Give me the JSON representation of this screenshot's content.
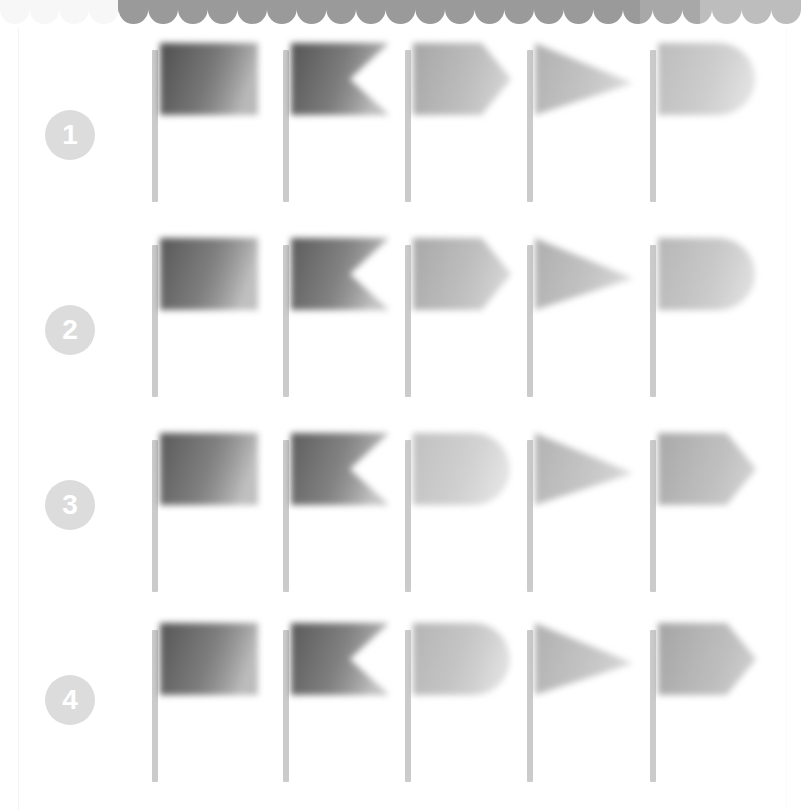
{
  "page": {
    "background_color": "#ffffff",
    "width": 801,
    "height": 810
  },
  "top_strip": {
    "name": "scalloped-top-strip",
    "style": "wavy-scallop",
    "segments": [
      {
        "from_x": 0,
        "to_x": 118,
        "color": "#f7f7f7"
      },
      {
        "from_x": 118,
        "to_x": 640,
        "color": "#9a9a9a"
      },
      {
        "from_x": 640,
        "to_x": 700,
        "color": "#a8a8a8"
      },
      {
        "from_x": 700,
        "to_x": 801,
        "color": "#bdbdbd"
      }
    ],
    "scallop_count": 27,
    "height": 24
  },
  "badge_style": {
    "fill_color": "#dcdcdc",
    "text_color": "#ffffff",
    "diameter": 50
  },
  "pole": {
    "color": "#cbcbcb",
    "width": 6,
    "height": 152
  },
  "flag_shapes": {
    "rectangle": "rectangle",
    "swallowtail": "swallowtail",
    "pointed": "pointed-pennant",
    "triangle": "triangle-pennant",
    "rounded": "rounded-end"
  },
  "rows": [
    {
      "number": "1",
      "badge_name": "row-badge-1",
      "top": 40,
      "badge_top": 110,
      "flags": [
        {
          "shape": "rectangle",
          "label": "rectangle-flag",
          "dark": "#4f4f4f",
          "light": "#b9b9b9",
          "left": 152
        },
        {
          "shape": "swallowtail",
          "label": "swallowtail-flag",
          "dark": "#555555",
          "light": "#bdbdbd",
          "left": 283
        },
        {
          "shape": "pointed",
          "label": "pointed-flag",
          "dark": "#a6a6a6",
          "light": "#d2d2d2",
          "left": 405
        },
        {
          "shape": "triangle",
          "label": "triangle-flag",
          "dark": "#b0b0b0",
          "light": "#dadada",
          "left": 527
        },
        {
          "shape": "rounded",
          "label": "rounded-flag",
          "dark": "#bcbcbc",
          "light": "#e0e0e0",
          "left": 650
        }
      ]
    },
    {
      "number": "2",
      "badge_name": "row-badge-2",
      "top": 235,
      "badge_top": 305,
      "flags": [
        {
          "shape": "rectangle",
          "label": "rectangle-flag",
          "dark": "#585858",
          "light": "#c0c0c0",
          "left": 152
        },
        {
          "shape": "swallowtail",
          "label": "swallowtail-flag",
          "dark": "#5c5c5c",
          "light": "#c2c2c2",
          "left": 283
        },
        {
          "shape": "pointed",
          "label": "pointed-flag",
          "dark": "#a8a8a8",
          "light": "#d4d4d4",
          "left": 405
        },
        {
          "shape": "triangle",
          "label": "triangle-flag",
          "dark": "#aeaeae",
          "light": "#d8d8d8",
          "left": 527
        },
        {
          "shape": "rounded",
          "label": "rounded-flag",
          "dark": "#b6b6b6",
          "light": "#dcdcdc",
          "left": 650
        }
      ]
    },
    {
      "number": "3",
      "badge_name": "row-badge-3",
      "top": 430,
      "badge_top": 480,
      "flags": [
        {
          "shape": "rectangle",
          "label": "rectangle-flag",
          "dark": "#5a5a5a",
          "light": "#c0c0c0",
          "left": 152
        },
        {
          "shape": "swallowtail",
          "label": "swallowtail-flag",
          "dark": "#5e5e5e",
          "light": "#c4c4c4",
          "left": 283
        },
        {
          "shape": "rounded",
          "label": "rounded-flag",
          "dark": "#c0c0c0",
          "light": "#e2e2e2",
          "left": 405
        },
        {
          "shape": "triangle",
          "label": "triangle-flag",
          "dark": "#b2b2b2",
          "light": "#d8d8d8",
          "left": 527
        },
        {
          "shape": "pointed",
          "label": "pointed-flag",
          "dark": "#a8a8a8",
          "light": "#cfcfcf",
          "left": 650
        }
      ]
    },
    {
      "number": "4",
      "badge_name": "row-badge-4",
      "top": 620,
      "badge_top": 675,
      "flags": [
        {
          "shape": "rectangle",
          "label": "rectangle-flag",
          "dark": "#565656",
          "light": "#bcbcbc",
          "left": 152
        },
        {
          "shape": "swallowtail",
          "label": "swallowtail-flag",
          "dark": "#5a5a5a",
          "light": "#c0c0c0",
          "left": 283
        },
        {
          "shape": "rounded",
          "label": "rounded-flag",
          "dark": "#b4b4b4",
          "light": "#dedede",
          "left": 405
        },
        {
          "shape": "triangle",
          "label": "triangle-flag",
          "dark": "#b0b0b0",
          "light": "#d6d6d6",
          "left": 527
        },
        {
          "shape": "pointed",
          "label": "pointed-flag",
          "dark": "#a4a4a4",
          "light": "#cbcbcb",
          "left": 650
        }
      ]
    }
  ]
}
